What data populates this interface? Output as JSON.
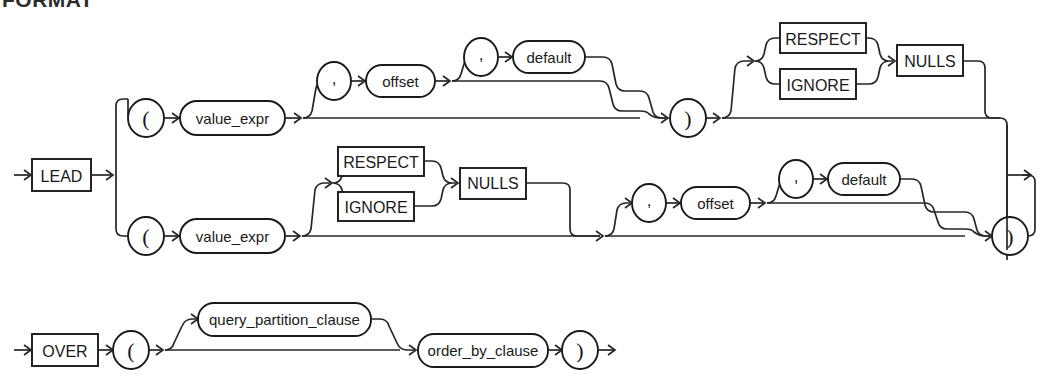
{
  "page": {
    "heading_partial": "FORMAT",
    "background_color": "#ffffff",
    "line_color": "#262626",
    "text_color": "#1a1a1a"
  },
  "diagram": {
    "name": "lead-syntax-diagram",
    "type": "railroad",
    "rows": [
      {
        "id": "lead-row",
        "entry_label": "LEAD",
        "branches": [
          {
            "id": "upper-branch",
            "sequence": [
              "(",
              "value_expr",
              ",",
              "offset",
              ",",
              "default",
              ")",
              "RESPECT",
              "IGNORE",
              "NULLS"
            ]
          },
          {
            "id": "lower-branch",
            "sequence": [
              "(",
              "value_expr",
              "RESPECT",
              "IGNORE",
              "NULLS",
              ",",
              "offset",
              ",",
              "default",
              ")"
            ]
          }
        ]
      },
      {
        "id": "over-row",
        "entry_label": "OVER",
        "sequence": [
          "(",
          "query_partition_clause",
          "order_by_clause",
          ")"
        ]
      }
    ]
  },
  "labels": {
    "lead": "LEAD",
    "over": "OVER",
    "respect": "RESPECT",
    "ignore": "IGNORE",
    "nulls": "NULLS",
    "value_expr": "value_expr",
    "offset": "offset",
    "default": "default",
    "query_partition_clause": "query_partition_clause",
    "order_by_clause": "order_by_clause",
    "open_paren": "(",
    "close_paren": ")",
    "comma": ","
  },
  "nodes": {
    "lead_box": {
      "label": "LEAD"
    },
    "over_box": {
      "label": "OVER"
    },
    "up_open_paren": {
      "label": "("
    },
    "up_value_expr": {
      "label": "value_expr"
    },
    "up_comma1": {
      "label": ","
    },
    "up_offset": {
      "label": "offset"
    },
    "up_comma2": {
      "label": ","
    },
    "up_default": {
      "label": "default"
    },
    "up_close_paren": {
      "label": ")"
    },
    "up_respect": {
      "label": "RESPECT"
    },
    "up_ignore": {
      "label": "IGNORE"
    },
    "up_nulls": {
      "label": "NULLS"
    },
    "lo_open_paren": {
      "label": "("
    },
    "lo_value_expr": {
      "label": "value_expr"
    },
    "lo_respect": {
      "label": "RESPECT"
    },
    "lo_ignore": {
      "label": "IGNORE"
    },
    "lo_nulls": {
      "label": "NULLS"
    },
    "lo_comma1": {
      "label": ","
    },
    "lo_offset": {
      "label": "offset"
    },
    "lo_comma2": {
      "label": ","
    },
    "lo_default": {
      "label": "default"
    },
    "lo_close_paren": {
      "label": ")"
    },
    "ov_open_paren": {
      "label": "("
    },
    "ov_query_partition_clause": {
      "label": "query_partition_clause"
    },
    "ov_order_by_clause": {
      "label": "order_by_clause"
    },
    "ov_close_paren": {
      "label": ")"
    }
  }
}
